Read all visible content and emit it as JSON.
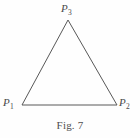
{
  "figure": {
    "caption": "Fig. 7",
    "background_color": "#fefefe",
    "stroke_color": "#585858",
    "text_color": "#4a4a4a",
    "vertices": [
      {
        "id": "p1",
        "label_base": "P",
        "label_sub": "1",
        "x": 22,
        "y": 105
      },
      {
        "id": "p2",
        "label_base": "P",
        "label_sub": "2",
        "x": 117,
        "y": 105
      },
      {
        "id": "p3",
        "label_base": "P",
        "label_sub": "3",
        "x": 68,
        "y": 20
      }
    ],
    "edges": [
      {
        "from": "p1",
        "to": "p3"
      },
      {
        "from": "p3",
        "to": "p2"
      },
      {
        "from": "p2",
        "to": "p1"
      }
    ],
    "labels": {
      "p1": {
        "base": "P",
        "sub": "1"
      },
      "p2": {
        "base": "P",
        "sub": "2"
      },
      "p3": {
        "base": "P",
        "sub": "3"
      }
    }
  }
}
